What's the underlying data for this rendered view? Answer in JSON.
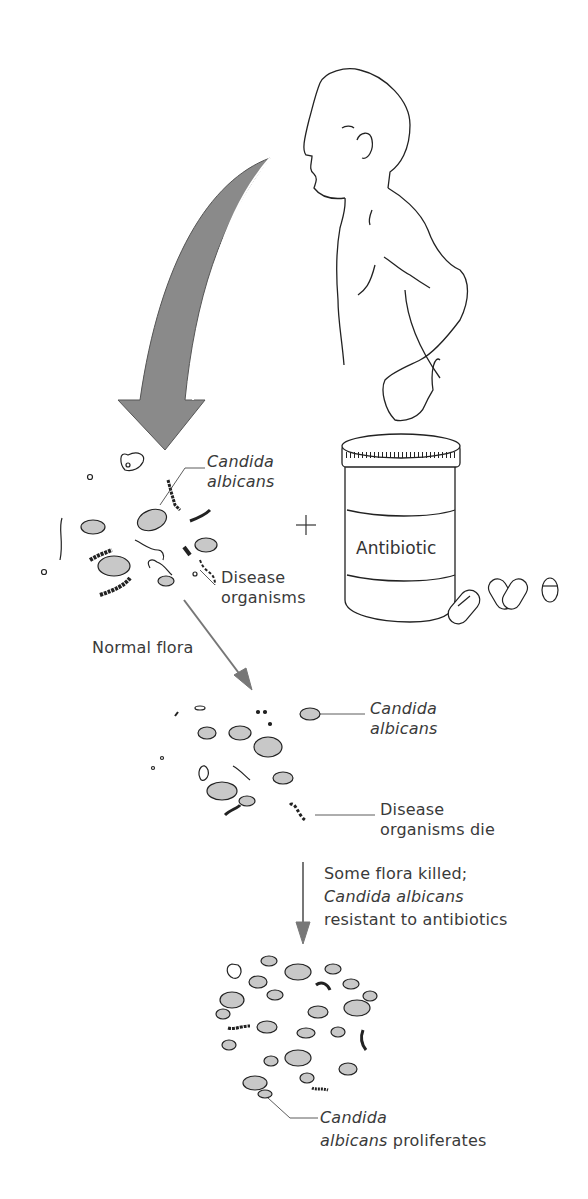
{
  "diagram": {
    "colors": {
      "arrow_fill": "#8a8a8a",
      "cell_fill": "#c8c8c8",
      "line": "#2a2a2a",
      "text": "#3a3a3a"
    },
    "stage1": {
      "candida_label_line1": "Candida",
      "candida_label_line2": "albicans",
      "disease_label_line1": "Disease",
      "disease_label_line2": "organisms"
    },
    "plus_sign": "+",
    "jar_label": "Antibiotic",
    "arrow1_label": "Normal flora",
    "stage2": {
      "candida_label_line1": "Candida",
      "candida_label_line2": "albicans",
      "disease_label_line1": "Disease",
      "disease_label_line2": "organisms die"
    },
    "arrow2_label": {
      "line1": "Some flora killed;",
      "line2": "Candida albicans",
      "line3": "resistant to antibiotics"
    },
    "stage3": {
      "label_line1": "Candida",
      "label_line2_italic": "albicans",
      "label_line2_rest": " proliferates"
    }
  }
}
